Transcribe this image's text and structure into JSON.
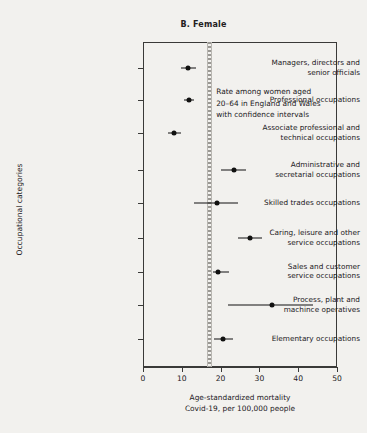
{
  "panel": {
    "title": "B. Female"
  },
  "annotation": {
    "lines": [
      "Rate among women aged",
      "20–64 in England and Wales",
      "with confidence intervals"
    ]
  },
  "axis": {
    "y_title": "Occupational categories",
    "x_title_line1": "Age-standardized mortality",
    "x_title_line2": "Covid-19, per 100,000 people"
  },
  "chart_data": {
    "type": "scatter",
    "title": "B. Female",
    "xlabel": "Age-standardized mortality Covid-19, per 100,000 people",
    "ylabel": "Occupational categories",
    "xlim": [
      0,
      50
    ],
    "xticks": [
      0,
      10,
      20,
      30,
      40,
      50
    ],
    "xticklabels": [
      "0",
      "10",
      "20",
      "30",
      "40",
      "50"
    ],
    "grid": false,
    "legend": null,
    "reference_line": {
      "value": 16.8,
      "style": "dotted-vertical",
      "color": "#9a9893"
    },
    "marker_color": "#111110",
    "categories": [
      "Managers, directors and senior officials",
      "Professional occupations",
      "Associate professional and technical occupations",
      "Administrative and secretarial occupations",
      "Skilled trades occupations",
      "Caring, leisure and other service occupations",
      "Sales and customer service occupations",
      "Process, plant and machince operatives",
      "Elementary occupations"
    ],
    "points": [
      {
        "category": "Managers, directors and senior officials",
        "value": 11.6,
        "ci_low": 9.8,
        "ci_high": 13.6
      },
      {
        "category": "Professional occupations",
        "value": 11.8,
        "ci_low": 10.6,
        "ci_high": 13.2
      },
      {
        "category": "Associate professional and technical occupations",
        "value": 8.0,
        "ci_low": 6.4,
        "ci_high": 9.8
      },
      {
        "category": "Administrative and secretarial occupations",
        "value": 23.4,
        "ci_low": 20.0,
        "ci_high": 26.5
      },
      {
        "category": "Skilled trades occupations",
        "value": 19.0,
        "ci_low": 13.2,
        "ci_high": 24.5
      },
      {
        "category": "Caring, leisure and other service occupations",
        "value": 27.6,
        "ci_low": 24.6,
        "ci_high": 30.8
      },
      {
        "category": "Sales and customer service occupations",
        "value": 19.4,
        "ci_low": 18.0,
        "ci_high": 22.2
      },
      {
        "category": "Process, plant and machince operatives",
        "value": 33.2,
        "ci_low": 22.0,
        "ci_high": 43.8
      },
      {
        "category": "Elementary occupations",
        "value": 20.5,
        "ci_low": 18.4,
        "ci_high": 23.2
      }
    ]
  },
  "category_labels": [
    [
      "Managers, directors and",
      "senior officials"
    ],
    [
      "Professional occupations"
    ],
    [
      "Associate professional and",
      "technical occupations"
    ],
    [
      "Administrative and",
      "secretarial occupations"
    ],
    [
      "Skilled trades occupations"
    ],
    [
      "Caring, leisure and other",
      "service occupations"
    ],
    [
      "Sales and customer",
      "service occupations"
    ],
    [
      "Process, plant and",
      "machince operatives"
    ],
    [
      "Elementary occupations"
    ]
  ]
}
